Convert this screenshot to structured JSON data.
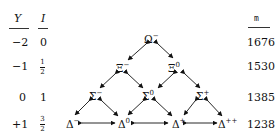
{
  "headers": {
    "Y": "Y",
    "I": "I",
    "m": "m"
  },
  "rows": [
    {
      "Y": "−2",
      "I_num": "0",
      "I_den": "",
      "mass": "1676"
    },
    {
      "Y": "−1",
      "I_num": "1",
      "I_den": "2",
      "mass": "1530"
    },
    {
      "Y": "0",
      "I_num": "1",
      "I_den": "",
      "mass": "1385"
    },
    {
      "Y": "+1",
      "I_num": "3",
      "I_den": "2",
      "mass": "1238"
    }
  ],
  "particles": {
    "omega_minus": {
      "base": "Ω",
      "charge": "−"
    },
    "xi_minus": {
      "base": "Ξ",
      "charge": "−"
    },
    "xi_zero": {
      "base": "Ξ",
      "charge": "0"
    },
    "sigma_minus": {
      "base": "Σ",
      "charge": "−"
    },
    "sigma_zero": {
      "base": "Σ",
      "charge": "0"
    },
    "sigma_plus": {
      "base": "Σ",
      "charge": "+"
    },
    "delta_minus": {
      "base": "Δ",
      "charge": "−"
    },
    "delta_zero": {
      "base": "Δ",
      "charge": "0"
    },
    "delta_plus": {
      "base": "Δ",
      "charge": "+"
    },
    "delta_plusplus": {
      "base": "Δ",
      "charge": "++"
    }
  }
}
